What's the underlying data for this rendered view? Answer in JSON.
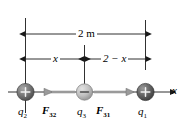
{
  "figure": {
    "type": "physics-force-diagram",
    "background_color": "#ffffff",
    "line_color": "#1a1a1a",
    "dimensions": {
      "total": {
        "label": "2 m",
        "name": "total-separation"
      },
      "left_segment": {
        "label": "x",
        "name": "distance-x"
      },
      "right_segment": {
        "label": "2 − x",
        "name": "distance-two-minus-x"
      }
    },
    "charges": [
      {
        "id": "q2",
        "label": "q",
        "subscript": "2",
        "sign": "+",
        "fill": "#6e6e6e",
        "position": "left"
      },
      {
        "id": "q3",
        "label": "q",
        "subscript": "3",
        "sign": "−",
        "fill": "#b8b8b8",
        "position": "middle"
      },
      {
        "id": "q1",
        "label": "q",
        "subscript": "1",
        "sign": "+",
        "fill": "#5a5a5a",
        "position": "right"
      }
    ],
    "forces": [
      {
        "id": "F32",
        "label": "F",
        "subscript": "32",
        "direction": "left",
        "color": "#9a9a9a"
      },
      {
        "id": "F31",
        "label": "F",
        "subscript": "31",
        "direction": "right",
        "color": "#9a9a9a"
      }
    ],
    "axis": {
      "label": "x",
      "direction": "right"
    }
  }
}
